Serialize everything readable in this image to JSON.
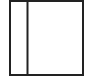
{
  "icon": {
    "name": "sidebar-layout-icon",
    "stroke_color": "#222222",
    "background_color": "#ffffff"
  }
}
